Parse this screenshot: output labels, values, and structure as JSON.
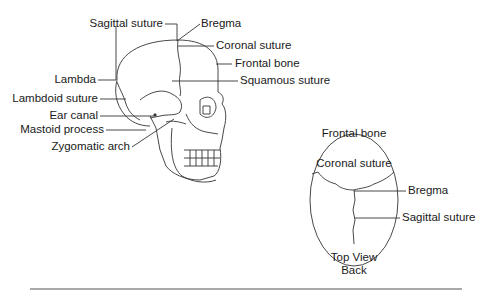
{
  "side_view": {
    "labels": {
      "sagittal_suture": "Sagittal suture",
      "bregma": "Bregma",
      "coronal_suture": "Coronal suture",
      "frontal_bone": "Frontal bone",
      "squamous_suture": "Squamous suture",
      "lambda": "Lambda",
      "lambdoid_suture": "Lambdoid suture",
      "ear_canal": "Ear canal",
      "mastoid_process": "Mastoid process",
      "zygomatic_arch": "Zygomatic arch"
    }
  },
  "top_view": {
    "labels": {
      "frontal_bone": "Frontal bone",
      "coronal_suture": "Coronal suture",
      "bregma": "Bregma",
      "sagittal_suture": "Sagittal suture"
    },
    "caption_line1": "Top View",
    "caption_line2": "Back"
  },
  "colors": {
    "line": "#333333",
    "text": "#1a1a1a"
  }
}
